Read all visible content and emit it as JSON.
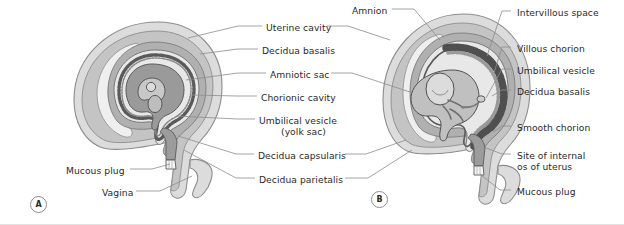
{
  "figure": {
    "background_color": "#ffffff",
    "leader_line_color": "#8d8d8d"
  },
  "palette": {
    "uterine_wall": "#dcdcdc",
    "myometrium_outline": "#8d8d8d",
    "decidua_parietalis": "#c4c4c4",
    "uterine_cavity": "#efefef",
    "decidua_capsularis": "#b0b0b0",
    "chorionic_cavity": "#e8e8e8",
    "amniotic_sac": "#9a9a9a",
    "embryo": "#a8a8a8",
    "villi_dark": "#6f6f6f",
    "cervix_canal": "#9c9c9c",
    "mucous_plug": "#f2f2f2",
    "outline": "#555555",
    "text": "#2a2a2a"
  },
  "panels": [
    {
      "id": "A",
      "marker": "A"
    },
    {
      "id": "B",
      "marker": "B"
    }
  ],
  "labels": {
    "center_column": [
      {
        "id": "uterine-cavity",
        "text": "Uterine cavity",
        "x": 266,
        "y": 29
      },
      {
        "id": "decidua-basalis-a",
        "text": "Decidua basalis",
        "x": 262,
        "y": 52
      },
      {
        "id": "amniotic-sac",
        "text": "Amniotic sac",
        "x": 270,
        "y": 76
      },
      {
        "id": "chorionic-cavity",
        "text": "Chorionic cavity",
        "x": 261,
        "y": 99
      },
      {
        "id": "umbilical-vesicle-a",
        "text": "Umbilical vesicle",
        "x": 259,
        "y": 122
      },
      {
        "id": "yolk-sac",
        "text": "(yolk sac)",
        "x": 281,
        "y": 133
      },
      {
        "id": "decidua-capsularis",
        "text": "Decidua capsularis",
        "x": 258,
        "y": 157
      },
      {
        "id": "decidua-parietalis",
        "text": "Decidua parietalis",
        "x": 259,
        "y": 181
      }
    ],
    "left_column": [
      {
        "id": "mucous-plug-a",
        "text": "Mucous plug",
        "x": 72,
        "y": 172
      },
      {
        "id": "vagina",
        "text": "Vagina",
        "x": 108,
        "y": 194
      }
    ],
    "top_column": [
      {
        "id": "amnion",
        "text": "Amnion",
        "x": 356,
        "y": 12
      }
    ],
    "right_column": [
      {
        "id": "intervillous-space",
        "text": "Intervillous space",
        "x": 515,
        "y": 14
      },
      {
        "id": "villous-chorion",
        "text": "Villous chorion",
        "x": 515,
        "y": 50
      },
      {
        "id": "umbilical-vesicle-b",
        "text": "Umbilical vesicle",
        "x": 515,
        "y": 72
      },
      {
        "id": "decidua-basalis-b",
        "text": "Decidua basalis",
        "x": 515,
        "y": 93
      },
      {
        "id": "smooth-chorion",
        "text": "Smooth chorion",
        "x": 515,
        "y": 129
      },
      {
        "id": "site-internal-os-1",
        "text": "Site of internal",
        "x": 515,
        "y": 157
      },
      {
        "id": "site-internal-os-2",
        "text": "os of uterus",
        "x": 515,
        "y": 168
      },
      {
        "id": "mucous-plug-b",
        "text": "Mucous plug",
        "x": 515,
        "y": 193
      }
    ]
  }
}
